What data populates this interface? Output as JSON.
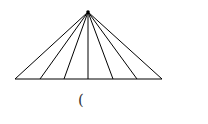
{
  "diagram": {
    "type": "fan-triangle",
    "apex": [
      88,
      12
    ],
    "base": {
      "y": 79,
      "x_start": 15,
      "x_end": 162
    },
    "rays_to_base_x": [
      15,
      40,
      64,
      88,
      113,
      137,
      162
    ],
    "stroke_color": "#000000"
  },
  "caption": {
    "text": "("
  }
}
